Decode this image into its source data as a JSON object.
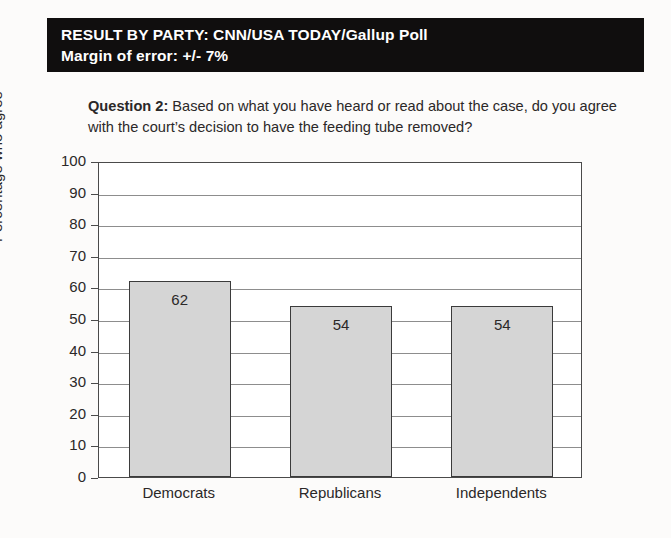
{
  "banner": {
    "line1": "RESULT BY PARTY: CNN/USA TODAY/Gallup Poll",
    "line2": "Margin of error: +/- 7%"
  },
  "question": {
    "prefix": "Question 2:",
    "text": " Based on what you have heard or read about the case, do you agree with the court’s decision to have the feeding tube removed?"
  },
  "chart_data": {
    "type": "bar",
    "title": "",
    "categories": [
      "Democrats",
      "Republicans",
      "Independents"
    ],
    "values": [
      62,
      54,
      54
    ],
    "data_labels": [
      "62",
      "54",
      "54"
    ],
    "xlabel": "",
    "ylabel": "Percentage who agree",
    "ylim": [
      0,
      100
    ],
    "ytick_step": 10,
    "yticks": [
      0,
      10,
      20,
      30,
      40,
      50,
      60,
      70,
      80,
      90,
      100
    ],
    "ytick_labels": [
      "0",
      "10",
      "20",
      "30",
      "40",
      "50",
      "60",
      "70",
      "80",
      "90",
      "100"
    ],
    "grid": true,
    "legend": false,
    "bar_fill_color": "#d5d5d5",
    "bar_border_color": "#3b3b3b",
    "plot_border_color": "#4a4a4a",
    "gridline_color": "#8d8d8d"
  },
  "colors": {
    "banner_background": "#100e0e",
    "banner_text": "#ffffff",
    "page_background": "#fcfbfa",
    "body_text": "#231f20"
  }
}
